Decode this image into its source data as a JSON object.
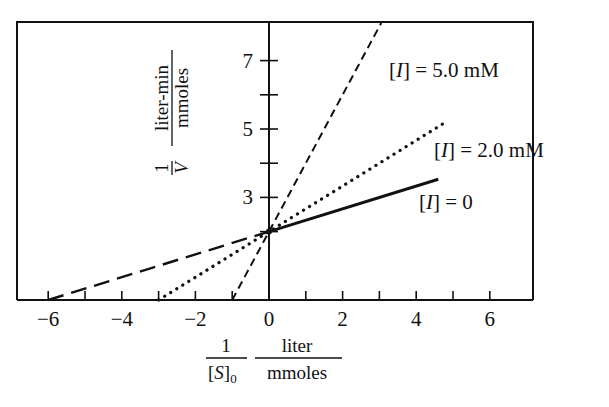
{
  "chart_data": {
    "type": "line",
    "title": "",
    "xlabel": "1/[S]0  liter/mmoles",
    "ylabel": "1/V  liter-min/mmoles",
    "xlabel_parts": {
      "num": "1",
      "den": "[S]",
      "den_sub": "0",
      "unit_num": "liter",
      "unit_den": "mmoles"
    },
    "ylabel_parts": {
      "num": "1",
      "den": "V",
      "unit_num": "liter-min",
      "unit_den": "mmoles"
    },
    "xlim": [
      -7,
      7.2
    ],
    "ylim": [
      0,
      8.2
    ],
    "x_ticks": [
      -6,
      -5,
      -4,
      -3,
      -2,
      -1,
      0,
      1,
      2,
      3,
      4,
      5,
      6
    ],
    "x_tick_labels": [
      "−6",
      "",
      "−4",
      "",
      "−2",
      "",
      "0",
      "",
      "2",
      "",
      "4",
      "",
      "6"
    ],
    "y_ticks": [
      2,
      3,
      4,
      5,
      6,
      7
    ],
    "y_tick_labels": [
      "",
      "3",
      "",
      "5",
      "",
      "7"
    ],
    "grid": false,
    "legend_position": "inline-labels",
    "series": [
      {
        "name": "[I] = 0",
        "label_italic": "I",
        "label_value": "0",
        "style": "solid",
        "x": [
          -6,
          0,
          4.6
        ],
        "y": [
          0,
          2,
          3.53
        ],
        "note": "solid for x>=0, long-dashed extrapolation for x<0"
      },
      {
        "name": "[I] = 2.0 mM",
        "label_italic": "I",
        "label_value": "2.0 mM",
        "style": "dotted",
        "x": [
          -3,
          0,
          4.8
        ],
        "y": [
          0,
          2,
          5.2
        ]
      },
      {
        "name": "[I] = 5.0 mM",
        "label_italic": "I",
        "label_value": "5.0 mM",
        "style": "short-dashed",
        "x": [
          -1,
          0,
          3.05
        ],
        "y": [
          0,
          2,
          8.1
        ]
      }
    ]
  }
}
